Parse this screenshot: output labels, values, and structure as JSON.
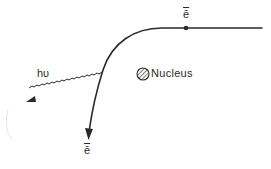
{
  "diagram": {
    "labels": {
      "electron_incoming": "ē",
      "electron_outgoing": "ē",
      "photon": "hυ",
      "nucleus": "Nucleus"
    },
    "colors": {
      "stroke": "#2a2a2a",
      "background": "#ffffff"
    }
  }
}
